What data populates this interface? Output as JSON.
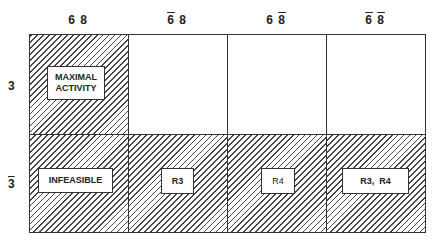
{
  "columns": [
    {
      "a": "6",
      "b": "8",
      "a_bar": false,
      "b_bar": false
    },
    {
      "a": "6",
      "b": "8",
      "a_bar": true,
      "b_bar": false
    },
    {
      "a": "6",
      "b": "8",
      "a_bar": false,
      "b_bar": true
    },
    {
      "a": "6",
      "b": "8",
      "a_bar": true,
      "b_bar": true
    }
  ],
  "rows": [
    {
      "label": "3",
      "bar": false
    },
    {
      "label": "3",
      "bar": true
    }
  ],
  "cells": {
    "r1c1": {
      "label_line1": "MAXIMAL",
      "label_line2": "ACTIVITY",
      "hatched": true
    },
    "r1c2": {
      "hatched": false
    },
    "r1c3": {
      "hatched": false
    },
    "r1c4": {
      "hatched": false
    },
    "r2c1": {
      "label": "INFEASIBLE",
      "hatched": true
    },
    "r2c2": {
      "label": "R3",
      "hatched": true
    },
    "r2c3": {
      "label": "R4",
      "hatched": true
    },
    "r2c4": {
      "label": "R3,  R4",
      "hatched": true
    }
  }
}
